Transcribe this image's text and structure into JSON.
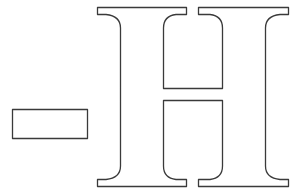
{
  "figure": {
    "glyphs": [
      "-",
      "H"
    ],
    "stroke_color": "#3a3a3a",
    "fill_color": "#ffffff",
    "background_color": "#ffffff"
  }
}
